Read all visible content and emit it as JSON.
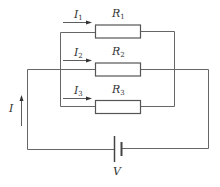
{
  "diagram": {
    "type": "parallel-resistor-circuit",
    "branches": [
      {
        "current_label": "I",
        "current_sub": "1",
        "resistor_label": "R",
        "resistor_sub": "1"
      },
      {
        "current_label": "I",
        "current_sub": "2",
        "resistor_label": "R",
        "resistor_sub": "2"
      },
      {
        "current_label": "I",
        "current_sub": "3",
        "resistor_label": "R",
        "resistor_sub": "3"
      }
    ],
    "total_current_label": "I",
    "source_label": "V",
    "colors": {
      "wire": "#666666",
      "text": "#333333",
      "background": "#ffffff"
    }
  }
}
